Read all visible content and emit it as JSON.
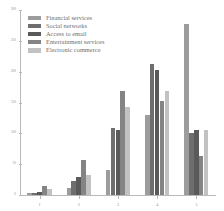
{
  "chart_data": {
    "type": "bar",
    "title": "",
    "subtitle": "",
    "xlabel": "",
    "ylabel": "",
    "categories": [
      "1",
      "2",
      "3",
      "4",
      "5"
    ],
    "series": [
      {
        "name": "Financial services",
        "color": "#9c9c9c",
        "values": [
          3,
          12,
          40,
          130,
          278
        ]
      },
      {
        "name": "Social networks",
        "color": "#6e6e6e",
        "values": [
          4,
          22,
          108,
          212,
          100
        ]
      },
      {
        "name": "Access to email",
        "color": "#5a5a5a",
        "values": [
          5,
          30,
          105,
          202,
          105
        ]
      },
      {
        "name": "Entertainment services",
        "color": "#848484",
        "values": [
          14,
          57,
          168,
          152,
          64
        ]
      },
      {
        "name": "Electronic commerce",
        "color": "#c2c2c2",
        "values": [
          9,
          33,
          142,
          168,
          106
        ]
      }
    ],
    "ylim": [
      0,
      300
    ],
    "yticks": [
      0,
      50,
      100,
      150,
      200,
      250,
      300
    ],
    "ytick_labels": [
      "0",
      "50",
      "100",
      "150",
      "200",
      "250",
      "300"
    ],
    "grid": false,
    "legend_position": "top-left",
    "annotations": []
  },
  "legend": {
    "items": [
      {
        "label": "Financial services"
      },
      {
        "label": "Social networks"
      },
      {
        "label": "Access to email"
      },
      {
        "label": "Entertainment services"
      },
      {
        "label": "Electronic commerce"
      }
    ]
  }
}
